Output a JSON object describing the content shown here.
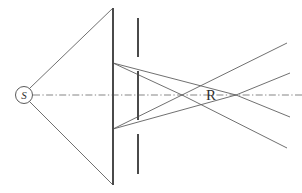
{
  "figure": {
    "width": 302,
    "height": 193,
    "background_color": "#ffffff"
  },
  "colors": {
    "ray_stroke": "#606060",
    "plate_stroke": "#4a4a4a",
    "axis_stroke": "#707070",
    "label_fill": "#303030",
    "source_fill": "#ffffff"
  },
  "labels": {
    "source": "S",
    "focus": "R"
  },
  "source_marker": {
    "name": "source-point",
    "cx": 24,
    "cy": 95,
    "r": 8.5,
    "label": "S",
    "label_x": 24,
    "label_y": 99
  },
  "focus_marker": {
    "name": "focus-point",
    "label": "R",
    "label_x": 211,
    "label_y": 100
  },
  "optical_axis": {
    "name": "optical-axis",
    "x1": 33,
    "y1": 95,
    "x2": 302,
    "y2": 95,
    "style": "dash-dot"
  },
  "plates": {
    "front_plate_x": 113,
    "rear_plate_x": 138,
    "segments": [
      {
        "name": "front-plate-upper-bar",
        "x": 113,
        "y1": 8,
        "y2": 63
      },
      {
        "name": "front-plate-middle-bar",
        "x": 113,
        "y1": 63,
        "y2": 129
      },
      {
        "name": "front-plate-lower-bar",
        "x": 113,
        "y1": 129,
        "y2": 185
      },
      {
        "name": "rear-plate-upper-bar",
        "x": 138,
        "y1": 18,
        "y2": 57
      },
      {
        "name": "rear-plate-middle-bar",
        "x": 138,
        "y1": 71,
        "y2": 120
      },
      {
        "name": "rear-plate-lower-bar",
        "x": 138,
        "y1": 134,
        "y2": 174
      }
    ]
  },
  "rays": [
    {
      "name": "ray-source-upper",
      "x1": 30,
      "y1": 88,
      "x2": 113,
      "y2": 8
    },
    {
      "name": "ray-source-lower",
      "x1": 30,
      "y1": 102,
      "x2": 113,
      "y2": 185
    },
    {
      "name": "ray-upper-marginal-in",
      "x1": 113,
      "y1": 63,
      "x2": 236,
      "y2": 95
    },
    {
      "name": "ray-lower-marginal-in",
      "x1": 113,
      "y1": 129,
      "x2": 236,
      "y2": 95
    },
    {
      "name": "ray-upper-cone-in",
      "x1": 113,
      "y1": 63,
      "x2": 182,
      "y2": 95
    },
    {
      "name": "ray-lower-cone-in",
      "x1": 113,
      "y1": 129,
      "x2": 182,
      "y2": 95
    },
    {
      "name": "ray-upper-cone-out",
      "x1": 182,
      "y1": 95,
      "x2": 287,
      "y2": 43
    },
    {
      "name": "ray-lower-cone-out",
      "x1": 182,
      "y1": 95,
      "x2": 287,
      "y2": 148
    },
    {
      "name": "ray-upper-marginal-out",
      "x1": 236,
      "y1": 95,
      "x2": 290,
      "y2": 73
    },
    {
      "name": "ray-lower-marginal-out",
      "x1": 236,
      "y1": 95,
      "x2": 290,
      "y2": 117
    }
  ]
}
